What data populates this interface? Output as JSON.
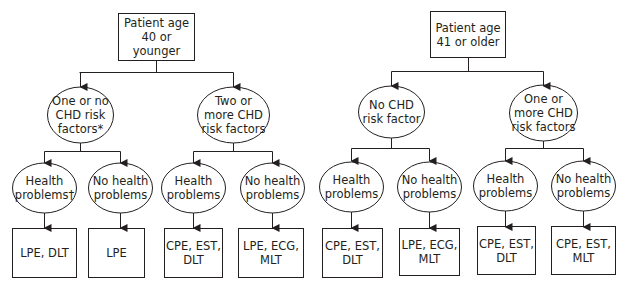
{
  "diagram": {
    "left_tree": {
      "root": "Patient age\n40 or younger",
      "branches": [
        {
          "label": "One or no\nCHD risk\nfactors*",
          "children": [
            {
              "label": "Health\nproblems†",
              "result": "LPE, DLT"
            },
            {
              "label": "No health\nproblems",
              "result": "LPE"
            }
          ]
        },
        {
          "label": "Two or\nmore CHD\nrisk factors",
          "children": [
            {
              "label": "Health\nproblems",
              "result": "CPE, EST,\nDLT"
            },
            {
              "label": "No health\nproblems",
              "result": "LPE, ECG,\nMLT"
            }
          ]
        }
      ]
    },
    "right_tree": {
      "root": "Patient age\n41 or older",
      "branches": [
        {
          "label": "No CHD\nrisk factor",
          "children": [
            {
              "label": "Health\nproblems",
              "result": "CPE, EST,\nDLT"
            },
            {
              "label": "No health\nproblems",
              "result": "LPE, ECG,\nMLT"
            }
          ]
        },
        {
          "label": "One or\nmore CHD\nrisk factors",
          "children": [
            {
              "label": "Health\nproblems",
              "result": "CPE, EST,\nDLT"
            },
            {
              "label": "No health\nproblems",
              "result": "CPE, EST,\nMLT"
            }
          ]
        }
      ]
    }
  },
  "colors": {
    "line": "#231f20",
    "background": "#ffffff"
  }
}
